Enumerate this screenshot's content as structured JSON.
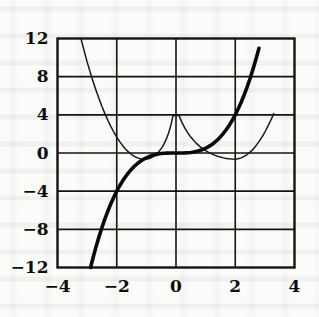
{
  "figure": {
    "kind": "math-graph",
    "background_color": "#fbfbf9",
    "ink_color": "#0e0d0c"
  },
  "chart_data": {
    "type": "line",
    "title": "",
    "subtitle": "",
    "xlabel": "",
    "ylabel": "",
    "xlim": [
      -4,
      4
    ],
    "ylim": [
      -12,
      12
    ],
    "xticks": [
      -4,
      -2,
      0,
      2,
      4
    ],
    "yticks": [
      -12,
      -8,
      -4,
      0,
      4,
      8,
      12
    ],
    "xtick_labels": [
      "−4",
      "−2",
      "0",
      "2",
      "4"
    ],
    "ytick_labels": [
      "−12",
      "−8",
      "−4",
      "0",
      "4",
      "8",
      "12"
    ],
    "grid": true,
    "grid_color": "#15130f",
    "grid_linewidth": 1.6,
    "frame": true,
    "legend": false,
    "legend_position": "none",
    "annotations": [],
    "series": [
      {
        "name": "cubic-curve",
        "style": "thick",
        "color": "#0b0a09",
        "linewidth": 3.6,
        "expression": "y = x^3 / 2",
        "x": [
          -3.3,
          -3.2,
          -3.1,
          -3.0,
          -2.9,
          -2.8,
          -2.7,
          -2.6,
          -2.5,
          -2.4,
          -2.3,
          -2.2,
          -2.1,
          -2.0,
          -1.9,
          -1.8,
          -1.7,
          -1.6,
          -1.5,
          -1.4,
          -1.3,
          -1.2,
          -1.1,
          -1.0,
          -0.9,
          -0.8,
          -0.7,
          -0.6,
          -0.5,
          -0.4,
          -0.3,
          -0.2,
          -0.1,
          0.0,
          0.1,
          0.2,
          0.3,
          0.4,
          0.5,
          0.6,
          0.7,
          0.8,
          0.9,
          1.0,
          1.1,
          1.2,
          1.3,
          1.4,
          1.5,
          1.6,
          1.7,
          1.8,
          1.9,
          2.0,
          2.1,
          2.2,
          2.3,
          2.4,
          2.5,
          2.6,
          2.7,
          2.8,
          2.9,
          3.0,
          3.1,
          3.2,
          3.3
        ],
        "y": [
          -17.97,
          -16.38,
          -14.9,
          -13.5,
          -12.19,
          -10.98,
          -9.84,
          -8.79,
          -7.81,
          -6.91,
          -6.08,
          -5.32,
          -4.63,
          -4.0,
          -3.43,
          -2.92,
          -2.46,
          -2.05,
          -1.69,
          -1.37,
          -1.1,
          -0.86,
          -0.67,
          -0.5,
          -0.36,
          -0.26,
          -0.17,
          -0.11,
          -0.06,
          -0.03,
          -0.01,
          0.0,
          0.0,
          0.0,
          0.0,
          0.0,
          0.01,
          0.03,
          0.06,
          0.11,
          0.17,
          0.26,
          0.36,
          0.5,
          0.67,
          0.86,
          1.1,
          1.37,
          1.69,
          2.05,
          2.46,
          2.92,
          3.43,
          4.0,
          4.63,
          5.32,
          6.08,
          6.91,
          7.81,
          8.79,
          9.84,
          10.98,
          12.19,
          13.5,
          14.9,
          16.38,
          17.97
        ]
      },
      {
        "name": "thin-curve",
        "style": "thin",
        "color": "#1a1816",
        "linewidth": 1.5,
        "expression": "y = x^3/2 + 2/x^2",
        "x": [
          -3.4,
          -3.3,
          -3.2,
          -3.1,
          -3.0,
          -2.9,
          -2.8,
          -2.7,
          -2.6,
          -2.5,
          -2.4,
          -2.3,
          -2.2,
          -2.1,
          -2.0,
          -1.9,
          -1.8,
          -1.7,
          -1.6,
          -1.5,
          -1.4,
          -1.3,
          -1.2,
          -1.1,
          -1.0,
          -0.95,
          -0.9,
          -0.85,
          -0.8,
          -0.75,
          -0.7,
          -0.65,
          -0.6,
          -0.55,
          -0.5,
          -0.45,
          -0.4,
          -0.35,
          -0.3,
          -0.25,
          -0.2,
          -0.15,
          -0.1,
          0.1,
          0.2,
          0.3,
          0.4,
          0.5,
          0.6,
          0.7,
          0.8,
          0.9,
          1.0,
          1.1,
          1.2,
          1.3,
          1.4,
          1.5,
          1.6,
          1.7,
          1.8,
          1.9,
          2.0,
          2.1,
          2.2,
          2.3,
          2.4,
          2.5,
          2.6,
          2.7,
          2.8,
          2.9,
          3.0,
          3.1,
          3.2,
          3.3
        ],
        "y": [
          14.6,
          13.2,
          11.9,
          10.7,
          9.55,
          8.5,
          7.5,
          6.57,
          5.7,
          4.88,
          4.13,
          3.43,
          2.79,
          2.2,
          1.67,
          1.19,
          0.77,
          0.4,
          0.09,
          -0.16,
          -0.36,
          -0.51,
          -0.61,
          -0.65,
          -0.64,
          -0.61,
          -0.57,
          -0.51,
          -0.43,
          -0.34,
          -0.22,
          -0.09,
          0.07,
          0.25,
          0.46,
          0.7,
          0.98,
          1.3,
          1.67,
          2.1,
          2.61,
          3.21,
          3.94,
          3.94,
          3.21,
          2.61,
          2.1,
          1.67,
          1.3,
          0.98,
          0.7,
          0.46,
          0.25,
          0.07,
          -0.09,
          -0.22,
          -0.34,
          -0.43,
          -0.51,
          -0.57,
          -0.61,
          -0.64,
          -0.65,
          -0.61,
          -0.51,
          -0.36,
          -0.16,
          0.09,
          0.4,
          0.77,
          1.19,
          1.67,
          2.2,
          2.79,
          3.43,
          4.13
        ]
      }
    ],
    "key_points": [
      {
        "label": "cubic through origin",
        "x": 0,
        "y": 0
      },
      {
        "label": "cubic at x=-2",
        "x": -2,
        "y": -4
      },
      {
        "label": "cubic at x=2",
        "x": 2,
        "y": 4
      },
      {
        "label": "thin-curve minimum",
        "x": -0.2,
        "y": 1
      },
      {
        "label": "thin-curve at x=-2",
        "x": -2,
        "y": 4
      }
    ]
  }
}
